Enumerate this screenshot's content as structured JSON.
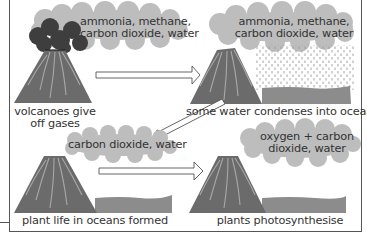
{
  "diagram": {
    "colors": {
      "volcano": "#6b6b6b",
      "volcano_streak": "#a8a8a8",
      "cloud": "#bdbdbd",
      "smoke": "#3e3e3e",
      "ocean": "#8c8c8c",
      "rain": "#9a9a9a",
      "border": "#555555",
      "text": "#333333"
    },
    "panels": [
      {
        "id": 1,
        "caption_line1": "volcanoes give",
        "caption_line2": "off gases",
        "cloud_line1": "ammonia, methane,",
        "cloud_line2": "carbon dioxide, water",
        "features": [
          "volcano",
          "smoke",
          "cloud"
        ]
      },
      {
        "id": 2,
        "caption": "some water condenses into oceans",
        "cloud_line1": "ammonia, methane,",
        "cloud_line2": "carbon dioxide, water",
        "features": [
          "volcano",
          "cloud",
          "rain",
          "ocean"
        ]
      },
      {
        "id": 3,
        "caption": "plant life in oceans formed",
        "cloud_line1": "carbon dioxide, water",
        "features": [
          "volcano",
          "cloud",
          "ocean"
        ]
      },
      {
        "id": 4,
        "caption": "plants photosynthesise",
        "cloud_line1": "oxygen + carbon",
        "cloud_line2": "dioxide, water",
        "features": [
          "volcano",
          "cloud",
          "ocean"
        ]
      }
    ],
    "arrows": [
      {
        "from": 1,
        "to": 2,
        "direction": "right"
      },
      {
        "from": 2,
        "to": 3,
        "direction": "down-left"
      },
      {
        "from": 3,
        "to": 4,
        "direction": "right"
      }
    ]
  }
}
